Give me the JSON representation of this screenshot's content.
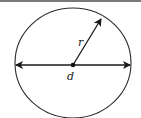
{
  "diagram": {
    "labels": {
      "radius": "r",
      "diameter": "d"
    },
    "colors": {
      "stroke": "#1a1a1a",
      "top_bar": "#7a7a7a",
      "background": "#ffffff"
    }
  }
}
